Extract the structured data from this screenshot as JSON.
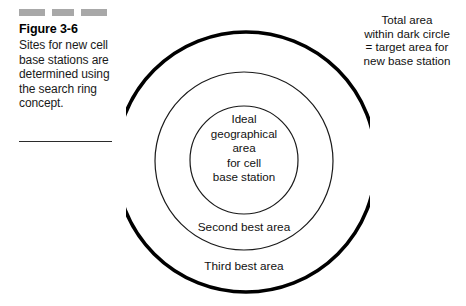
{
  "figure": {
    "caption": {
      "title": "Figure 3-6",
      "body": "Sites for new cell base stations are determined using the search ring concept.",
      "decorative_marks": [
        "mark-1",
        "mark-2",
        "mark-3"
      ],
      "rule": "horizontal-rule"
    },
    "annotation": {
      "lines": [
        "Total area",
        "within dark circle",
        "= target area for",
        "new base station"
      ],
      "full_text": "Total area within dark circle = target area for new base station"
    },
    "diagram": {
      "type": "concentric-circles",
      "rings": [
        {
          "name": "outer-ring",
          "label": "Third best area",
          "stroke_color": "#000000",
          "stroke_width": 3.4,
          "radius": 131
        },
        {
          "name": "middle-ring",
          "label": "Second best area",
          "stroke_color": "#1a1a1a",
          "stroke_width": 1.1,
          "radius": 89
        },
        {
          "name": "inner-ring",
          "label": "Ideal geographical area for cell base station",
          "stroke_color": "#1a1a1a",
          "stroke_width": 1.1,
          "radius": 54
        }
      ],
      "inner_label_lines": [
        "Ideal",
        "geographical",
        "area",
        "for cell",
        "base station"
      ],
      "middle_label": "Second best area",
      "outer_label": "Third best area"
    },
    "colors": {
      "background": "#ffffff",
      "ink": "#111111",
      "mark_gray": "#a8a8a8",
      "outer_circle": "#000000"
    }
  }
}
